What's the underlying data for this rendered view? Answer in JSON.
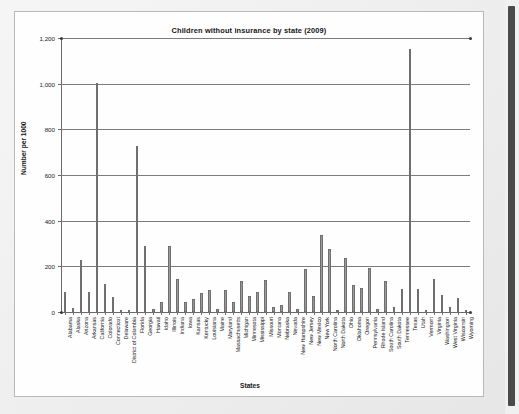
{
  "window": {
    "scrollbar_name": "vertical-scrollbar"
  },
  "chart_data": {
    "type": "bar",
    "title": "Children without insurance by state (2009)",
    "xlabel": "States",
    "ylabel": "Number per 1000",
    "ylim": [
      0,
      1200
    ],
    "yticks": [
      0,
      200,
      400,
      600,
      800,
      1000,
      1200
    ],
    "ytick_labels": [
      "0",
      "200",
      "400",
      "600",
      "800",
      "1,000",
      "1,200"
    ],
    "grid": true,
    "legend": "none",
    "bar_color": "#9a9a9a",
    "categories": [
      "Alabama",
      "Alaska",
      "Arizona",
      "Arkansas",
      "California",
      "Colorado",
      "Connecticut",
      "Delaware",
      "District of Columbia",
      "Florida",
      "Georgia",
      "Hawaii",
      "Idaho",
      "Illinois",
      "Indiana",
      "Iowa",
      "Kansas",
      "Kentucky",
      "Louisiana",
      "Maine",
      "Maryland",
      "Massachusetts",
      "Michigan",
      "Minnesota",
      "Mississippi",
      "Missouri",
      "Montana",
      "Nebraska",
      "Nevada",
      "New Hampshire",
      "New Jersey",
      "New Mexico",
      "New York",
      "North Carolina",
      "North Dakota",
      "Ohio",
      "Oklahoma",
      "Oregon",
      "Pennsylvania",
      "Rhode Island",
      "South Carolina",
      "South Dakota",
      "Tennessee",
      "Texas",
      "Utah",
      "Vermont",
      "Virginia",
      "Washington",
      "West Virginia",
      "Wisconsin",
      "Wyoming"
    ],
    "values": [
      88,
      18,
      226,
      86,
      1004,
      122,
      64,
      10,
      8,
      725,
      290,
      14,
      44,
      288,
      143,
      42,
      58,
      84,
      98,
      12,
      98,
      46,
      134,
      72,
      88,
      140,
      22,
      32,
      88,
      12,
      190,
      72,
      338,
      276,
      10,
      236,
      118,
      106,
      194,
      12,
      138,
      20,
      100,
      1152,
      102,
      8,
      146,
      76,
      22,
      62,
      10
    ]
  }
}
